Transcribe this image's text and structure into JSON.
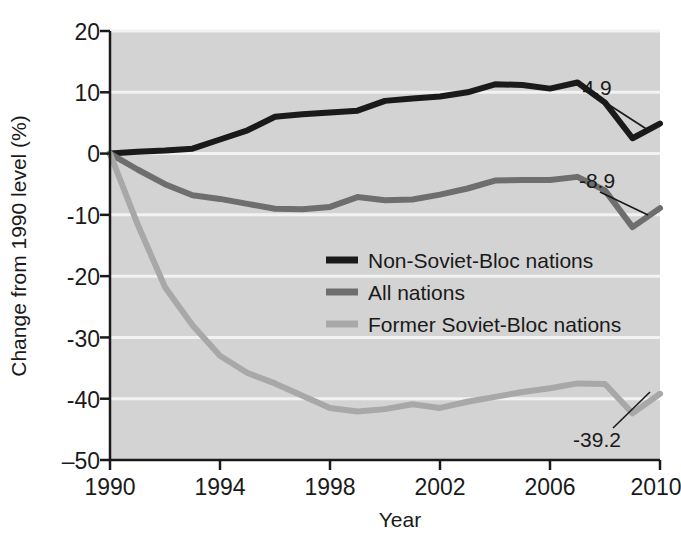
{
  "chart_data": {
    "type": "line",
    "title": "",
    "xlabel": "Year",
    "ylabel": "Change from 1990 level (%)",
    "xlim": [
      1990,
      2010
    ],
    "ylim": [
      -50,
      20
    ],
    "grid": true,
    "legend_position": "center",
    "xticks": [
      1990,
      1994,
      1998,
      2002,
      2006,
      2010
    ],
    "xtick_labels": [
      "1990",
      "1994",
      "1998",
      "2002",
      "2006",
      "2010"
    ],
    "yticks": [
      20,
      10,
      0,
      -10,
      -20,
      -30,
      -40,
      -50
    ],
    "ytick_labels": [
      "20",
      "10",
      "0",
      "-10",
      "-20",
      "-30",
      "-40",
      "–50"
    ],
    "x": [
      1990,
      1991,
      1992,
      1993,
      1994,
      1995,
      1996,
      1997,
      1998,
      1999,
      2000,
      2001,
      2002,
      2003,
      2004,
      2005,
      2006,
      2007,
      2008,
      2009,
      2010
    ],
    "series": [
      {
        "name": "Non-Soviet-Bloc nations",
        "color": "#1a1a1a",
        "values": [
          0.0,
          0.3,
          0.5,
          0.8,
          2.3,
          3.8,
          6.0,
          6.4,
          6.7,
          7.0,
          8.6,
          9.0,
          9.3,
          10.0,
          11.3,
          11.2,
          10.6,
          11.6,
          8.3,
          2.5,
          4.9
        ],
        "end_label": "4.9"
      },
      {
        "name": "All nations",
        "color": "#6e6e6e",
        "values": [
          0.0,
          -2.6,
          -5.0,
          -6.8,
          -7.4,
          -8.2,
          -9.0,
          -9.1,
          -8.7,
          -7.1,
          -7.6,
          -7.5,
          -6.7,
          -5.7,
          -4.4,
          -4.3,
          -4.3,
          -3.8,
          -6.0,
          -12.0,
          -8.9
        ],
        "end_label": "-8.9"
      },
      {
        "name": "Former Soviet-Bloc nations",
        "color": "#a8a8a8",
        "values": [
          0.0,
          -11.5,
          -21.8,
          -28.0,
          -33.0,
          -35.8,
          -37.5,
          -39.5,
          -41.5,
          -42.1,
          -41.7,
          -40.9,
          -41.5,
          -40.5,
          -39.7,
          -38.9,
          -38.3,
          -37.5,
          -37.6,
          -42.4,
          -39.2
        ],
        "end_label": "-39.2"
      }
    ],
    "annotations": [
      {
        "text": "4.9",
        "series": "Non-Soviet-Bloc nations",
        "x": 2010,
        "y": 4.9
      },
      {
        "text": "-8.9",
        "series": "All nations",
        "x": 2010,
        "y": -8.9
      },
      {
        "text": "-39.2",
        "series": "Former Soviet-Bloc nations",
        "x": 2010,
        "y": -39.2
      }
    ],
    "style": {
      "plot_background": "#d3d3d3",
      "gridline_color": "#f2f2f2",
      "axis_color": "#1a1a1a",
      "page_background": "#ffffff"
    }
  },
  "axes": {
    "y_title": "Change from 1990 level (%)",
    "x_title": "Year",
    "ytick_0": "20",
    "ytick_1": "10",
    "ytick_2": "0",
    "ytick_3": "-10",
    "ytick_4": "-20",
    "ytick_5": "-30",
    "ytick_6": "-40",
    "ytick_7": "–50",
    "xtick_0": "1990",
    "xtick_1": "1994",
    "xtick_2": "1998",
    "xtick_3": "2002",
    "xtick_4": "2006",
    "xtick_5": "2010"
  },
  "legend": {
    "items": [
      {
        "label": "Non-Soviet-Bloc nations",
        "color": "#1a1a1a"
      },
      {
        "label": "All nations",
        "color": "#6e6e6e"
      },
      {
        "label": "Former Soviet-Bloc nations",
        "color": "#a8a8a8"
      }
    ]
  },
  "labels": {
    "black_end": "4.9",
    "grey_end": "-8.9",
    "light_end": "-39.2"
  }
}
